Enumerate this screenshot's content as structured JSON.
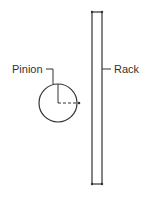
{
  "diagram": {
    "labels": {
      "pinion": "Pinion",
      "rack": "Rack"
    },
    "colors": {
      "stroke": "#333333",
      "background": "#ffffff"
    }
  }
}
